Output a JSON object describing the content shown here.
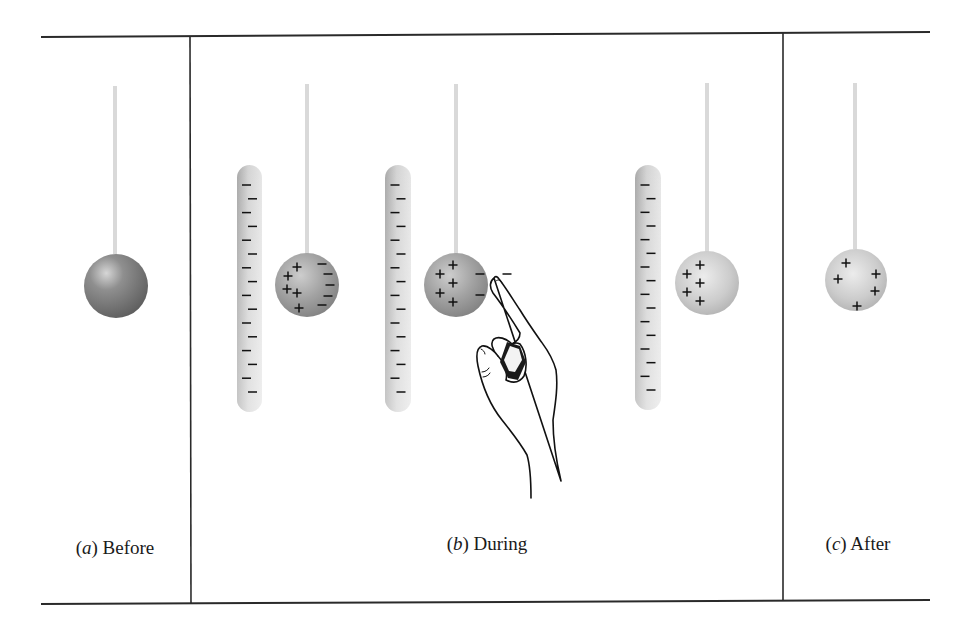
{
  "figure": {
    "panels": [
      {
        "id": "a",
        "letter": "a",
        "caption": "Before",
        "label_x": 115,
        "objects": [
          {
            "type": "suspended-sphere",
            "cx": 116,
            "cy": 286,
            "r": 32,
            "string_top": 86,
            "shade": "dark",
            "charges": []
          }
        ]
      },
      {
        "id": "b",
        "letter": "b",
        "caption": "During",
        "label_x": 487,
        "stages": [
          {
            "rod": {
              "x": 237,
              "y": 165,
              "w": 25,
              "h": 247,
              "charge": "-",
              "count": 16
            },
            "sphere": {
              "cx": 307,
              "cy": 285,
              "r": 32,
              "string_top": 84,
              "shade": "medium",
              "charges": [
                {
                  "s": "+",
                  "x": 297,
                  "y": 267
                },
                {
                  "s": "+",
                  "x": 288,
                  "y": 276
                },
                {
                  "s": "+",
                  "x": 287,
                  "y": 289
                },
                {
                  "s": "+",
                  "x": 297,
                  "y": 293
                },
                {
                  "s": "+",
                  "x": 299,
                  "y": 308
                },
                {
                  "s": "-",
                  "x": 322,
                  "y": 264
                },
                {
                  "s": "-",
                  "x": 328,
                  "y": 274
                },
                {
                  "s": "-",
                  "x": 330,
                  "y": 285
                },
                {
                  "s": "-",
                  "x": 328,
                  "y": 296
                },
                {
                  "s": "-",
                  "x": 322,
                  "y": 305
                }
              ]
            }
          },
          {
            "rod": {
              "x": 385,
              "y": 165,
              "w": 26,
              "h": 247,
              "charge": "-",
              "count": 16
            },
            "sphere": {
              "cx": 456,
              "cy": 285,
              "r": 32,
              "string_top": 84,
              "shade": "medium",
              "charges": [
                {
                  "s": "+",
                  "x": 453,
                  "y": 265
                },
                {
                  "s": "+",
                  "x": 440,
                  "y": 274
                },
                {
                  "s": "+",
                  "x": 453,
                  "y": 283
                },
                {
                  "s": "+",
                  "x": 440,
                  "y": 293
                },
                {
                  "s": "+",
                  "x": 453,
                  "y": 302
                },
                {
                  "s": "-",
                  "x": 480,
                  "y": 274
                },
                {
                  "s": "-",
                  "x": 480,
                  "y": 295
                }
              ]
            },
            "hand": {
              "present": true,
              "escaping_charge": {
                "s": "-",
                "x": 507,
                "y": 274
              }
            }
          },
          {
            "rod": {
              "x": 635,
              "y": 165,
              "w": 26,
              "h": 245,
              "charge": "-",
              "count": 16
            },
            "sphere": {
              "cx": 707,
              "cy": 283,
              "r": 32,
              "string_top": 83,
              "shade": "light",
              "charges": [
                {
                  "s": "+",
                  "x": 700,
                  "y": 265
                },
                {
                  "s": "+",
                  "x": 687,
                  "y": 274
                },
                {
                  "s": "+",
                  "x": 700,
                  "y": 283
                },
                {
                  "s": "+",
                  "x": 687,
                  "y": 292
                },
                {
                  "s": "+",
                  "x": 700,
                  "y": 301
                }
              ]
            }
          }
        ]
      },
      {
        "id": "c",
        "letter": "c",
        "caption": "After",
        "label_x": 858,
        "objects": [
          {
            "type": "suspended-sphere",
            "cx": 856,
            "cy": 280,
            "r": 31,
            "string_top": 83,
            "shade": "light",
            "charges": [
              {
                "s": "+",
                "x": 846,
                "y": 263
              },
              {
                "s": "+",
                "x": 838,
                "y": 279
              },
              {
                "s": "+",
                "x": 876,
                "y": 274
              },
              {
                "s": "+",
                "x": 875,
                "y": 291
              },
              {
                "s": "+",
                "x": 857,
                "y": 306
              }
            ]
          }
        ]
      }
    ],
    "frame": {
      "top_y": 36,
      "bottom_y": 602,
      "left_x": 41,
      "right_x": 930,
      "dividers_x": [
        190,
        783
      ]
    },
    "colors": {
      "line": "#2a2a2a",
      "rod": "#c9c9c9",
      "string": "#d8d8d8",
      "sphere_dark": "#7a7a7a",
      "sphere_medium": "#9c9c9c",
      "sphere_light": "#c4c4c4",
      "charge": "#111111"
    }
  },
  "labels": {
    "a": {
      "letter": "a",
      "text": " Before"
    },
    "b": {
      "letter": "b",
      "text": " During"
    },
    "c": {
      "letter": "c",
      "text": " After"
    }
  }
}
